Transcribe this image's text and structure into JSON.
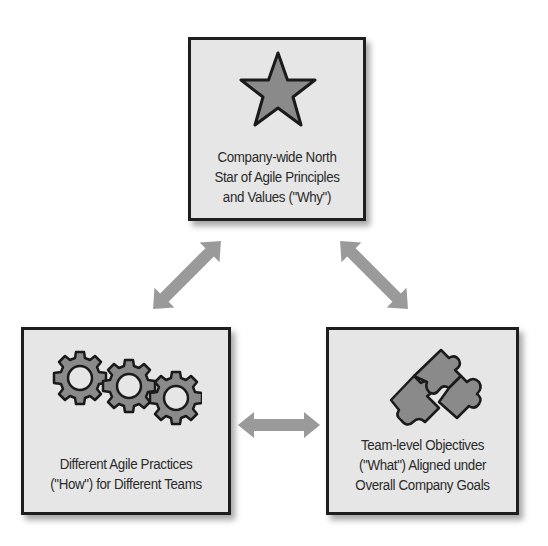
{
  "diagram": {
    "type": "three-node-cycle",
    "nodes": [
      {
        "id": "north-star",
        "icon": "star-icon",
        "lines": [
          "Company-wide North",
          "Star of Agile Principles",
          "and Values (\"Why\")"
        ]
      },
      {
        "id": "practices",
        "icon": "gears-icon",
        "lines": [
          "Different Agile Practices",
          "(\"How\") for Different Teams"
        ]
      },
      {
        "id": "objectives",
        "icon": "puzzle-icon",
        "lines": [
          "Team-level Objectives",
          "(\"What\") Aligned under",
          "Overall Company Goals"
        ]
      }
    ],
    "edges": [
      {
        "from": "north-star",
        "to": "practices",
        "style": "double-arrow"
      },
      {
        "from": "north-star",
        "to": "objectives",
        "style": "double-arrow"
      },
      {
        "from": "practices",
        "to": "objectives",
        "style": "double-arrow"
      }
    ],
    "colors": {
      "box_fill": "#e6e6e6",
      "box_border": "#1e1e1e",
      "icon_fill": "#8a8a8a",
      "arrow_fill": "#9a9a9a",
      "text": "#2a2a2a"
    }
  }
}
